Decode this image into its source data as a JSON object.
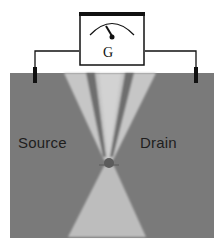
{
  "diagram": {
    "type": "schematic",
    "meter": {
      "label": "G",
      "icon": "galvanometer-dial-icon"
    },
    "electrodes": {
      "left_label": "Source",
      "right_label": "Drain"
    },
    "colors": {
      "substrate": "#7a7a7a",
      "electrode_light": "#c4c4c4",
      "electrode_dark": "#6a6a6a",
      "wire": "#111111",
      "junction_dot": "#5a5a5a",
      "background": "#ffffff"
    }
  }
}
